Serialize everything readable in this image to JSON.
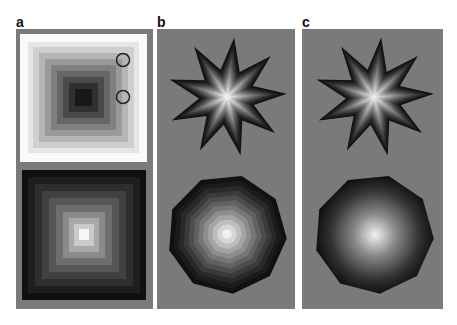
{
  "panels": [
    {
      "label": "a",
      "description": "Concentric square luminance staircase: top on white surround (dark center) with two circle markers, bottom on gray (light center)"
    },
    {
      "label": "b",
      "description": "Nine-pointed star and nonagon with stepped concentric luminance gradient on gray"
    },
    {
      "label": "c",
      "description": "Nine-pointed star and nonagon with smooth radial luminance gradient on gray"
    }
  ],
  "colors": {
    "background": "#7a7a7a",
    "surround": "#ffffff",
    "dark": "#111111",
    "light": "#f4f4f4"
  }
}
